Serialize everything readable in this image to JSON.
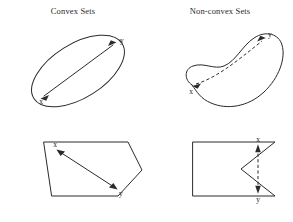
{
  "figure": {
    "titles": {
      "left": "Convex Sets",
      "right": "Non-convex Sets"
    },
    "point_labels": {
      "x": "x",
      "y": "y"
    },
    "colors": {
      "stroke": "#2a2a2a",
      "background": "#ffffff",
      "text": "#1a1a1a"
    },
    "panels": [
      {
        "id": "top-left",
        "column": "Convex Sets",
        "shape": "ellipse",
        "shape_description": "rotated ellipse",
        "segment_style": "solid",
        "segment_inside_shape": true,
        "arrowheads": "double",
        "labels": {
          "x": "x",
          "y": "y"
        },
        "x_position": "lower-left",
        "y_position": "upper-right"
      },
      {
        "id": "top-right",
        "column": "Non-convex Sets",
        "shape": "crescent",
        "shape_description": "banana / crescent blob",
        "segment_style": "dashed",
        "segment_inside_shape": false,
        "arrowheads": "double",
        "labels": {
          "x": "x",
          "y": "y"
        },
        "x_position": "lower-left lobe",
        "y_position": "upper-right lobe"
      },
      {
        "id": "bottom-left",
        "column": "Convex Sets",
        "shape": "polygon",
        "shape_description": "convex pentagon",
        "segment_style": "solid",
        "segment_inside_shape": true,
        "arrowheads": "double",
        "labels": {
          "x": "x",
          "y": "y"
        },
        "x_position": "upper-left",
        "y_position": "lower-right"
      },
      {
        "id": "bottom-right",
        "column": "Non-convex Sets",
        "shape": "polygon",
        "shape_description": "rectangle with V notch cut into right edge",
        "segment_style": "dashed",
        "segment_inside_shape": false,
        "arrowheads": "double",
        "labels": {
          "x": "x",
          "y": "y"
        },
        "x_position": "top",
        "y_position": "bottom"
      }
    ]
  }
}
